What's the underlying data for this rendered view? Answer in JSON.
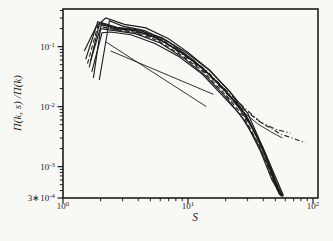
{
  "figure": {
    "background": "#f8f8f5",
    "ink": "#1c1c1c"
  },
  "chart_data": {
    "type": "line",
    "scale": "log-log",
    "title": "",
    "xlabel": "S",
    "ylabel": "Π(k, s) /Π(k)",
    "xlim": [
      1,
      110
    ],
    "ylim": [
      0.0003,
      0.435
    ],
    "grid": false,
    "legend": null,
    "xticks": [
      {
        "v": 1,
        "label": "10^0"
      },
      {
        "v": 10,
        "label": "10^1"
      },
      {
        "v": 100,
        "label": "10^2"
      }
    ],
    "yticks": [
      {
        "v": 0.1,
        "label": "10^-1"
      },
      {
        "v": 0.01,
        "label": "10^-2"
      },
      {
        "v": 0.001,
        "label": "10^-3"
      },
      {
        "v": 0.0003,
        "label": "3∗10^-4"
      }
    ],
    "series": [
      {
        "name": "guide-line-steep",
        "style": "solid",
        "w": 0.9,
        "points": [
          [
            2.2,
            0.12
          ],
          [
            14,
            0.01
          ]
        ]
      },
      {
        "name": "guide-line-shallow",
        "style": "solid",
        "w": 0.9,
        "points": [
          [
            2.4,
            0.085
          ],
          [
            16,
            0.016
          ]
        ]
      },
      {
        "name": "collapse-curve-1",
        "style": "solid",
        "w": 1.15,
        "points": [
          [
            1.75,
            0.03
          ],
          [
            2.0,
            0.2
          ],
          [
            2.6,
            0.185
          ],
          [
            3.8,
            0.165
          ],
          [
            6,
            0.115
          ],
          [
            9.5,
            0.062
          ],
          [
            14,
            0.032
          ],
          [
            20,
            0.0145
          ],
          [
            29,
            0.0055
          ],
          [
            38,
            0.0018
          ],
          [
            47,
            0.0006
          ],
          [
            56,
            0.00032
          ]
        ]
      },
      {
        "name": "collapse-curve-2",
        "style": "solid",
        "w": 1.1,
        "points": [
          [
            1.62,
            0.045
          ],
          [
            1.95,
            0.24
          ],
          [
            2.6,
            0.2
          ],
          [
            3.8,
            0.185
          ],
          [
            6,
            0.13
          ],
          [
            9.5,
            0.072
          ],
          [
            14,
            0.038
          ],
          [
            20,
            0.018
          ],
          [
            29,
            0.0072
          ],
          [
            39,
            0.0022
          ],
          [
            48,
            0.00065
          ],
          [
            57,
            0.00032
          ]
        ]
      },
      {
        "name": "collapse-curve-3",
        "style": "solid",
        "w": 1.2,
        "points": [
          [
            1.52,
            0.062
          ],
          [
            1.9,
            0.26
          ],
          [
            2.5,
            0.21
          ],
          [
            3.6,
            0.19
          ],
          [
            5.5,
            0.145
          ],
          [
            8.5,
            0.085
          ],
          [
            13,
            0.045
          ],
          [
            19,
            0.021
          ],
          [
            27,
            0.009
          ],
          [
            36,
            0.003
          ],
          [
            46,
            0.0009
          ],
          [
            55,
            0.00033
          ]
        ]
      },
      {
        "name": "collapse-curve-4",
        "style": "solid",
        "w": 1.1,
        "points": [
          [
            1.95,
            0.028
          ],
          [
            2.35,
            0.27
          ],
          [
            3.0,
            0.22
          ],
          [
            4.5,
            0.185
          ],
          [
            7,
            0.12
          ],
          [
            11,
            0.06
          ],
          [
            16,
            0.029
          ],
          [
            23,
            0.013
          ],
          [
            32,
            0.0048
          ],
          [
            42,
            0.0015
          ],
          [
            52,
            0.00043
          ],
          [
            58,
            0.00032
          ]
        ]
      },
      {
        "name": "collapse-curve-5",
        "style": "solid",
        "w": 1.15,
        "points": [
          [
            1.48,
            0.085
          ],
          [
            1.85,
            0.22
          ],
          [
            2.2,
            0.3
          ],
          [
            3.1,
            0.235
          ],
          [
            4.6,
            0.205
          ],
          [
            7,
            0.135
          ],
          [
            10,
            0.08
          ],
          [
            15,
            0.04
          ],
          [
            22,
            0.017
          ],
          [
            30,
            0.0065
          ],
          [
            40,
            0.002
          ],
          [
            50,
            0.0006
          ],
          [
            57,
            0.00032
          ]
        ]
      },
      {
        "name": "collapse-curve-6",
        "style": "solid",
        "w": 1.1,
        "points": [
          [
            1.7,
            0.038
          ],
          [
            2.05,
            0.17
          ],
          [
            2.4,
            0.175
          ],
          [
            3.5,
            0.158
          ],
          [
            5.5,
            0.112
          ],
          [
            8.5,
            0.068
          ],
          [
            13,
            0.035
          ],
          [
            18,
            0.017
          ],
          [
            26,
            0.0075
          ],
          [
            35,
            0.0028
          ],
          [
            44,
            0.001
          ],
          [
            52,
            0.0004
          ],
          [
            56,
            0.00032
          ]
        ]
      },
      {
        "name": "collapse-curve-7",
        "style": "dashed",
        "w": 1.1,
        "points": [
          [
            1.57,
            0.052
          ],
          [
            1.9,
            0.22
          ],
          [
            2.5,
            0.195
          ],
          [
            3.7,
            0.175
          ],
          [
            5.8,
            0.125
          ],
          [
            9,
            0.07
          ],
          [
            13.5,
            0.037
          ],
          [
            19.5,
            0.0165
          ],
          [
            28,
            0.0068
          ],
          [
            37,
            0.0023
          ],
          [
            46,
            0.00075
          ],
          [
            54,
            0.00034
          ]
        ]
      },
      {
        "name": "collapse-curve-8",
        "style": "solid",
        "w": 1.2,
        "points": [
          [
            1.66,
            0.058
          ],
          [
            2.05,
            0.25
          ],
          [
            2.7,
            0.21
          ],
          [
            4,
            0.19
          ],
          [
            6.2,
            0.14
          ],
          [
            9.8,
            0.078
          ],
          [
            14.5,
            0.042
          ],
          [
            21,
            0.019
          ],
          [
            30,
            0.0078
          ],
          [
            42,
            0.0016
          ],
          [
            58,
            0.00033
          ]
        ]
      },
      {
        "name": "tail-curve-dashdot-long",
        "style": "dashdot",
        "w": 1.1,
        "points": [
          [
            2.0,
            0.23
          ],
          [
            2.6,
            0.205
          ],
          [
            4,
            0.188
          ],
          [
            6,
            0.135
          ],
          [
            9.5,
            0.075
          ],
          [
            14,
            0.04
          ],
          [
            20,
            0.019
          ],
          [
            27,
            0.0105
          ],
          [
            38,
            0.0055
          ],
          [
            55,
            0.0035
          ],
          [
            87,
            0.0025
          ]
        ]
      },
      {
        "name": "tail-curve-dashdot-short",
        "style": "dashdot",
        "w": 1.1,
        "points": [
          [
            2.1,
            0.21
          ],
          [
            2.8,
            0.19
          ],
          [
            4.2,
            0.168
          ],
          [
            6.5,
            0.118
          ],
          [
            10,
            0.064
          ],
          [
            15,
            0.032
          ],
          [
            21,
            0.0155
          ],
          [
            28,
            0.009
          ],
          [
            38,
            0.0055
          ],
          [
            50,
            0.0042
          ],
          [
            66,
            0.0036
          ]
        ]
      },
      {
        "name": "tail-curve-solid",
        "style": "solid",
        "w": 0.9,
        "points": [
          [
            20,
            0.016
          ],
          [
            28,
            0.008
          ],
          [
            36,
            0.0052
          ],
          [
            46,
            0.0038
          ],
          [
            57,
            0.003
          ]
        ]
      }
    ]
  }
}
